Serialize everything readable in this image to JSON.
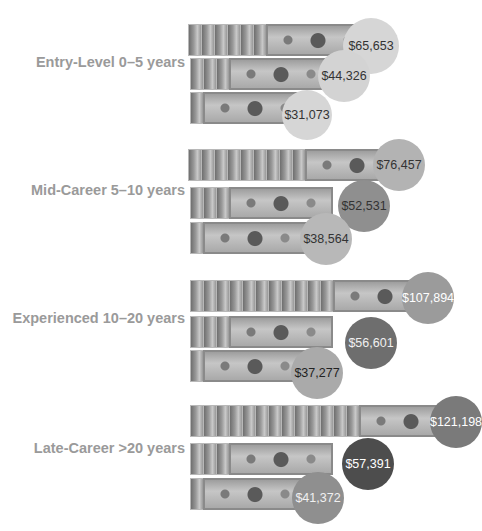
{
  "chart_data": {
    "type": "pictograph-bubble",
    "title": "",
    "categories": [
      "Entry-Level 0–5 years",
      "Mid-Career 5–10 years",
      "Experienced 10–20 years",
      "Late-Career >20 years"
    ],
    "series": [
      {
        "name": "top",
        "values": [
          65653,
          76457,
          107894,
          121198
        ]
      },
      {
        "name": "middle",
        "values": [
          44326,
          52531,
          56601,
          57391
        ]
      },
      {
        "name": "bottom",
        "values": [
          31073,
          38564,
          37277,
          41372
        ]
      }
    ]
  },
  "groups": [
    {
      "label": "Entry-Level  0–5 years",
      "values": [
        "$65,653",
        "$44,326",
        "$31,073"
      ],
      "colors": [
        "#d6d6d6",
        "#d3d3d3",
        "#d6d6d6"
      ],
      "text": [
        "#333333",
        "#333333",
        "#333333"
      ]
    },
    {
      "label": "Mid-Career  5–10 years",
      "values": [
        "$76,457",
        "$52,531",
        "$38,564"
      ],
      "colors": [
        "#b3b3b3",
        "#8f8f8f",
        "#b8b8b8"
      ],
      "text": [
        "#333333",
        "#333333",
        "#333333"
      ]
    },
    {
      "label": "Experienced 10–20 years",
      "values": [
        "$107,894",
        "$56,601",
        "$37,277"
      ],
      "colors": [
        "#9b9b9b",
        "#6e6e6e",
        "#aaaaaa"
      ],
      "text": [
        "#ffffff",
        "#f0f0f0",
        "#222222"
      ]
    },
    {
      "label": "Late-Career >20 years",
      "values": [
        "$121,198",
        "$57,391",
        "$41,372"
      ],
      "colors": [
        "#7a7a7a",
        "#4d4d4d",
        "#8f8f8f"
      ],
      "text": [
        "#ffffff",
        "#ffffff",
        "#f0f0f0"
      ]
    }
  ]
}
